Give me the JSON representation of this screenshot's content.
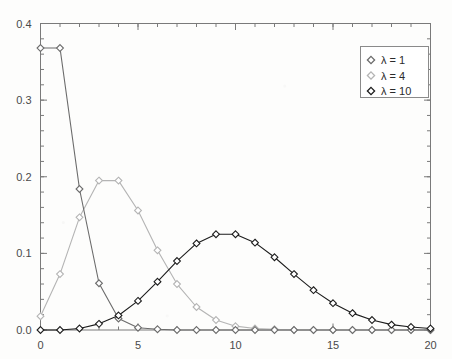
{
  "chart_data": {
    "type": "line",
    "title": "",
    "subtitle": "",
    "xlabel": "",
    "ylabel": "",
    "xlim": [
      0,
      20
    ],
    "ylim": [
      0.0,
      0.4
    ],
    "grid": false,
    "legend_position": "upper-right",
    "marker": "open-diamond",
    "x": [
      0,
      1,
      2,
      3,
      4,
      5,
      6,
      7,
      8,
      9,
      10,
      11,
      12,
      13,
      14,
      15,
      16,
      17,
      18,
      19,
      20
    ],
    "xticks": [
      0,
      5,
      10,
      15,
      20
    ],
    "xticklabels": [
      "0",
      "5",
      "10",
      "15",
      "20"
    ],
    "xminor_step": 1,
    "yticks": [
      0.0,
      0.1,
      0.2,
      0.3,
      0.4
    ],
    "yticklabels": [
      "0.0",
      "0.1",
      "0.2",
      "0.3",
      "0.4"
    ],
    "yminor_step": 0.02,
    "series": [
      {
        "name": "lambda-1",
        "legend_label": "λ = 1",
        "color": "#6b6b6b",
        "marker_fill": "#ffffff",
        "values": [
          0.368,
          0.368,
          0.184,
          0.061,
          0.015,
          0.003,
          0.001,
          0.0,
          0.0,
          0.0,
          0.0,
          0.0,
          0.0,
          0.0,
          0.0,
          0.0,
          0.0,
          0.0,
          0.0,
          0.0,
          0.0
        ]
      },
      {
        "name": "lambda-4",
        "legend_label": "λ = 4",
        "color": "#b4b4b4",
        "marker_fill": "#ffffff",
        "values": [
          0.018,
          0.073,
          0.147,
          0.195,
          0.195,
          0.156,
          0.104,
          0.06,
          0.03,
          0.013,
          0.005,
          0.002,
          0.001,
          0.0,
          0.0,
          0.0,
          0.0,
          0.0,
          0.0,
          0.0,
          0.0
        ]
      },
      {
        "name": "lambda-10",
        "legend_label": "λ = 10",
        "color": "#1c1c1c",
        "marker_fill": "#ffffff",
        "values": [
          0.0,
          0.0,
          0.002,
          0.008,
          0.019,
          0.038,
          0.063,
          0.09,
          0.113,
          0.125,
          0.125,
          0.114,
          0.095,
          0.073,
          0.052,
          0.035,
          0.022,
          0.013,
          0.007,
          0.004,
          0.002
        ]
      }
    ]
  },
  "axes": {
    "frame_color": "#7a7a7a",
    "tick_color": "#7a7a7a"
  },
  "legend": {
    "border_color": "#8a8a8a",
    "background": "#ffffff",
    "entries": [
      {
        "label": "λ = 1",
        "color": "#6b6b6b"
      },
      {
        "label": "λ = 4",
        "color": "#b4b4b4"
      },
      {
        "label": "λ = 10",
        "color": "#1c1c1c"
      }
    ]
  }
}
